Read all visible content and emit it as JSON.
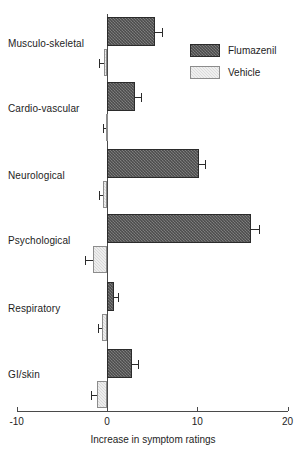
{
  "chart_data": {
    "type": "bar",
    "orientation": "horizontal",
    "title": "",
    "xlabel": "Increase in symptom ratings",
    "ylabel": "",
    "xlim": [
      -10,
      20
    ],
    "xticks": [
      -10,
      0,
      10,
      20
    ],
    "xticklabels": [
      "-10",
      "0",
      "10",
      "20"
    ],
    "grid": false,
    "legend_position": "upper right",
    "categories": [
      "Musculo-skeletal",
      "Cardio-vascular",
      "Neurological",
      "Psychological",
      "Respiratory",
      "GI/skin"
    ],
    "series": [
      {
        "name": "Flumazenil",
        "color": "#6e6e6e",
        "values": [
          5.3,
          3.1,
          10.2,
          15.9,
          0.8,
          2.8
        ],
        "errors": [
          0.8,
          0.7,
          0.7,
          0.9,
          0.4,
          0.6
        ]
      },
      {
        "name": "Vehicle",
        "color": "#d8d8d8",
        "values": [
          -0.3,
          -0.1,
          -0.4,
          -1.5,
          -0.5,
          -1.1
        ],
        "errors": [
          0.6,
          0.3,
          0.5,
          0.9,
          0.5,
          0.7
        ]
      }
    ]
  },
  "axis": {
    "x_title": "Increase in symptom ratings",
    "tick_labels": [
      "-10",
      "0",
      "10",
      "20"
    ]
  },
  "legend": {
    "items": [
      {
        "label": "Flumazenil",
        "swatch": "flu"
      },
      {
        "label": "Vehicle",
        "swatch": "veh"
      }
    ]
  }
}
